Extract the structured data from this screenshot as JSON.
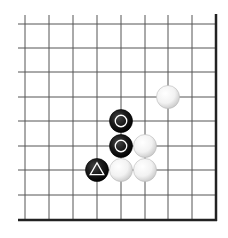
{
  "diagram": {
    "type": "go-board-corner",
    "corner": "lower-right",
    "grid": {
      "x_lines": [
        25,
        49,
        73,
        97,
        121,
        145,
        168,
        192,
        216
      ],
      "y_lines": [
        24,
        48,
        72,
        97,
        121,
        146,
        170,
        195,
        220
      ],
      "left_extent": 18,
      "top_extent": 15,
      "line_color": "#555555",
      "edge_color": "#222222",
      "stone_radius": 11.5
    },
    "stones": [
      {
        "color": "white",
        "col": 6,
        "row": 3,
        "mark": ""
      },
      {
        "color": "black",
        "col": 4,
        "row": 4,
        "mark": "circle"
      },
      {
        "color": "black",
        "col": 4,
        "row": 5,
        "mark": "circle"
      },
      {
        "color": "white",
        "col": 5,
        "row": 5,
        "mark": ""
      },
      {
        "color": "black",
        "col": 3,
        "row": 6,
        "mark": "triangle"
      },
      {
        "color": "white",
        "col": 4,
        "row": 6,
        "mark": ""
      },
      {
        "color": "white",
        "col": 5,
        "row": 6,
        "mark": ""
      }
    ]
  }
}
